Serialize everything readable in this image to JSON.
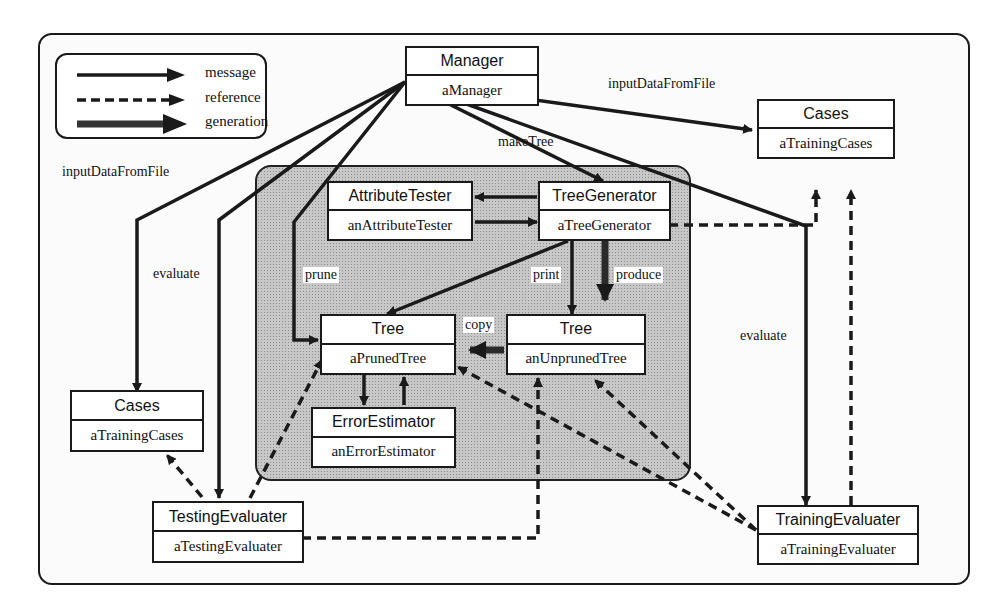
{
  "legend": {
    "items": [
      {
        "kind": "solid",
        "label": "message"
      },
      {
        "kind": "dashed",
        "label": "reference"
      },
      {
        "kind": "thick",
        "label": "generation"
      }
    ]
  },
  "objects": {
    "manager": {
      "class": "Manager",
      "instance": "aManager"
    },
    "cases_top": {
      "class": "Cases",
      "instance": "aTrainingCases"
    },
    "attribute_tester": {
      "class": "AttributeTester",
      "instance": "anAttributeTester"
    },
    "tree_generator": {
      "class": "TreeGenerator",
      "instance": "aTreeGenerator"
    },
    "pruned_tree": {
      "class": "Tree",
      "instance": "aPrunedTree"
    },
    "unpruned_tree": {
      "class": "Tree",
      "instance": "anUnprunedTree"
    },
    "error_estimator": {
      "class": "ErrorEstimator",
      "instance": "anErrorEstimator"
    },
    "cases_left": {
      "class": "Cases",
      "instance": "aTrainingCases"
    },
    "testing_evaluater": {
      "class": "TestingEvaluater",
      "instance": "aTestingEvaluater"
    },
    "training_evaluater": {
      "class": "TrainingEvaluater",
      "instance": "aTrainingEvaluater"
    }
  },
  "edge_labels": {
    "input_top": "inputDataFromFile",
    "input_left": "inputDataFromFile",
    "make_tree": "makeTree",
    "evaluate_left": "evaluate",
    "evaluate_right": "evaluate",
    "prune": "prune",
    "print": "print",
    "produce": "produce",
    "copy": "copy"
  },
  "colors": {
    "stroke": "#1a1a1a",
    "module_fill": "#c8c8c8",
    "background": "#ffffff"
  }
}
